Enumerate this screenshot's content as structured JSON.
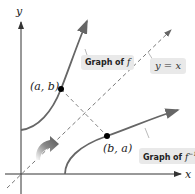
{
  "axes": {
    "x_label": "x",
    "y_label": "y"
  },
  "points": {
    "p1": "(a, b)",
    "p2": "(b, a)"
  },
  "labels": {
    "graph_f_prefix": "Graph of ",
    "graph_f_var": "f",
    "graph_finv_prefix": "Graph of ",
    "graph_finv_var": "f",
    "graph_finv_sup": "−1",
    "line": "y = x"
  },
  "colors": {
    "curve": "#555555",
    "axis": "#333333",
    "dashed": "#777777",
    "tag_bg": "#e9e9e9"
  }
}
